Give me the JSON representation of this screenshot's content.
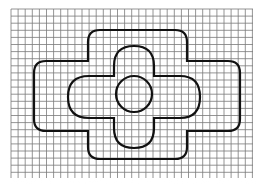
{
  "figure": {
    "grid": {
      "x0": 11,
      "y0": 9,
      "x1": 253,
      "y1": 178,
      "cell": 7.1,
      "color": "#7a7a7a"
    },
    "stroke_color": "#111111",
    "shapes": [
      {
        "id": "outer-cross",
        "label": "outer rounded cross outline"
      },
      {
        "id": "inner-plus",
        "label": "inner rounded plus outline"
      },
      {
        "id": "center-circle",
        "label": "central circle",
        "cx": 134,
        "cy": 94,
        "r": 18
      }
    ]
  }
}
